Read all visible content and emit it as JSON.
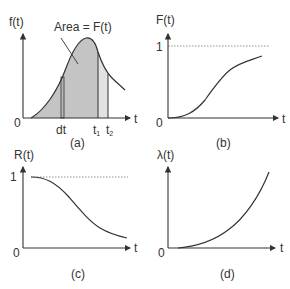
{
  "figure": {
    "panels": [
      {
        "id": "a",
        "caption": "(a)",
        "y_label": "f(t)",
        "x_label": "t",
        "origin": "0",
        "annotation": "Area = F(t)",
        "ticks": {
          "dt": "dt",
          "t1": "t",
          "t1_sub": "1",
          "t2": "t",
          "t2_sub": "2"
        },
        "description": "Probability density function f(t); shaded area under curve up to t equals F(t); strips at dt and between t1 and t2"
      },
      {
        "id": "b",
        "caption": "(b)",
        "y_label": "F(t)",
        "x_label": "t",
        "origin": "0",
        "asymptote": "1",
        "description": "Cumulative distribution F(t), S-shaped rising from 0 toward 1"
      },
      {
        "id": "c",
        "caption": "(c)",
        "y_label": "R(t)",
        "x_label": "t",
        "origin": "0",
        "asymptote": "1",
        "description": "Reliability function R(t), decreasing from 1 toward 0"
      },
      {
        "id": "d",
        "caption": "(d)",
        "y_label": "λ(t)",
        "x_label": "t",
        "origin": "0",
        "description": "Hazard rate λ(t), increasing convex curve"
      }
    ],
    "colors": {
      "line": "#333333",
      "fill": "#c4c4c4",
      "fill_light": "#e2e2e2",
      "dotted": "#888888"
    }
  }
}
